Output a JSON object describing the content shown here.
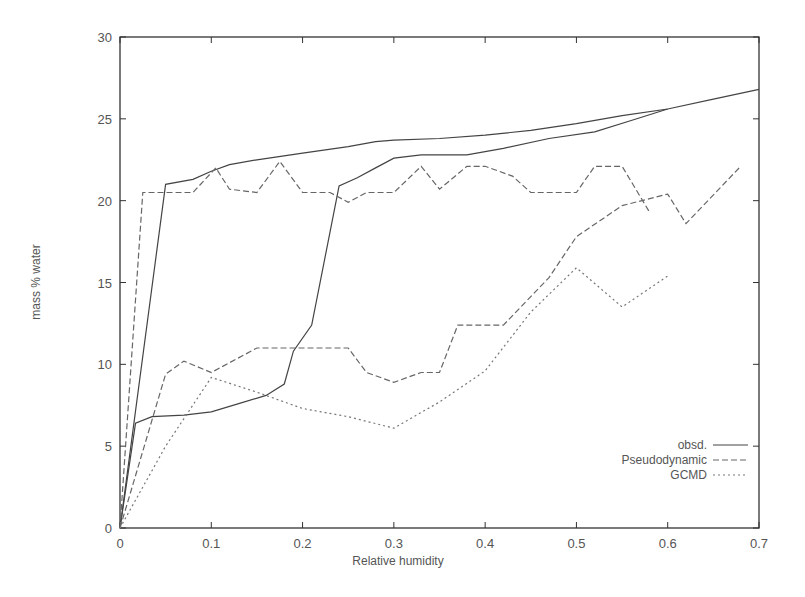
{
  "chart_data": {
    "type": "line",
    "title": "",
    "xlabel": "Relative humidity",
    "ylabel": "mass % water",
    "xlim": [
      0,
      0.7
    ],
    "ylim": [
      0,
      30
    ],
    "xticks": [
      "0",
      "0.1",
      "0.2",
      "0.3",
      "0.4",
      "0.5",
      "0.6",
      "0.7"
    ],
    "yticks": [
      "0",
      "5",
      "10",
      "15",
      "20",
      "25",
      "30"
    ],
    "grid": false,
    "legend_position": "lower right",
    "legend": [
      {
        "label": "obsd.",
        "style": "solid"
      },
      {
        "label": "Pseudodynamic",
        "style": "dashed"
      },
      {
        "label": "GCMD",
        "style": "dotted"
      }
    ],
    "series": [
      {
        "name": "obsd.",
        "style": "solid",
        "branch": "upper",
        "x": [
          0,
          0.05,
          0.08,
          0.1,
          0.12,
          0.15,
          0.2,
          0.25,
          0.28,
          0.3,
          0.35,
          0.4,
          0.45,
          0.5,
          0.55,
          0.6,
          0.65,
          0.7
        ],
        "y": [
          0,
          21.0,
          21.3,
          21.8,
          22.2,
          22.5,
          22.9,
          23.3,
          23.6,
          23.7,
          23.8,
          24.0,
          24.3,
          24.7,
          25.2,
          25.6,
          26.2,
          26.8
        ]
      },
      {
        "name": "obsd.",
        "style": "solid",
        "branch": "lower",
        "x": [
          0,
          0.017,
          0.035,
          0.07,
          0.1,
          0.13,
          0.16,
          0.18,
          0.19,
          0.21,
          0.24,
          0.26,
          0.28,
          0.3,
          0.33,
          0.38,
          0.42,
          0.47,
          0.52,
          0.56,
          0.6
        ],
        "y": [
          0,
          6.4,
          6.8,
          6.9,
          7.1,
          7.6,
          8.1,
          8.8,
          10.8,
          12.4,
          20.9,
          21.4,
          22.0,
          22.6,
          22.8,
          22.8,
          23.2,
          23.8,
          24.2,
          24.9,
          25.6
        ]
      },
      {
        "name": "Pseudodynamic",
        "style": "dashed",
        "branch": "upper",
        "x": [
          0,
          0.025,
          0.05,
          0.08,
          0.105,
          0.12,
          0.15,
          0.175,
          0.2,
          0.23,
          0.25,
          0.27,
          0.3,
          0.33,
          0.35,
          0.38,
          0.4,
          0.43,
          0.45,
          0.5,
          0.52,
          0.55,
          0.58
        ],
        "y": [
          0,
          20.5,
          20.5,
          20.5,
          22.0,
          20.7,
          20.5,
          22.4,
          20.5,
          20.5,
          19.9,
          20.5,
          20.5,
          22.1,
          20.7,
          22.1,
          22.1,
          21.5,
          20.5,
          20.5,
          22.1,
          22.1,
          19.3
        ]
      },
      {
        "name": "Pseudodynamic",
        "style": "dashed",
        "branch": "lower",
        "x": [
          0,
          0.05,
          0.07,
          0.1,
          0.15,
          0.25,
          0.27,
          0.3,
          0.33,
          0.35,
          0.37,
          0.42,
          0.47,
          0.5,
          0.55,
          0.6,
          0.62,
          0.68
        ],
        "y": [
          0,
          9.4,
          10.2,
          9.5,
          11.0,
          11.0,
          9.5,
          8.9,
          9.5,
          9.5,
          12.4,
          12.4,
          15.3,
          17.8,
          19.7,
          20.4,
          18.6,
          22.1
        ]
      },
      {
        "name": "GCMD",
        "style": "dotted",
        "branch": "main",
        "x": [
          0,
          0.05,
          0.1,
          0.15,
          0.2,
          0.25,
          0.3,
          0.35,
          0.4,
          0.45,
          0.5,
          0.55,
          0.6
        ],
        "y": [
          0,
          5.0,
          9.2,
          8.3,
          7.3,
          6.8,
          6.1,
          7.7,
          9.6,
          13.2,
          15.9,
          13.5,
          15.4
        ]
      }
    ]
  }
}
